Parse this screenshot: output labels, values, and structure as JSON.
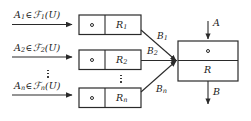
{
  "diagram": {
    "stroke_color": "#2a2a2a",
    "text_color": "#1a1a1a",
    "background": "#ffffff",
    "rows": [
      {
        "input_label_prefix": "A",
        "input_label_sub": "1",
        "membership_op": "∈",
        "family_symbol": "ℱ",
        "family_sub": "1",
        "family_arg": "(U)",
        "compose_symbol": "∘",
        "relation_label": "R",
        "relation_sub": "1",
        "output_label": "B",
        "output_sub": "1"
      },
      {
        "input_label_prefix": "A",
        "input_label_sub": "2",
        "membership_op": "∈",
        "family_symbol": "ℱ",
        "family_sub": "2",
        "family_arg": "(U)",
        "compose_symbol": "∘",
        "relation_label": "R",
        "relation_sub": "2",
        "output_label": "B",
        "output_sub": "2"
      },
      {
        "input_label_prefix": "A",
        "input_label_sub": "n",
        "membership_op": "∈",
        "family_symbol": "ℱ",
        "family_sub": "n",
        "family_arg": "(U)",
        "compose_symbol": "∘",
        "relation_label": "R",
        "relation_sub": "n",
        "output_label": "B",
        "output_sub": "n"
      }
    ],
    "ellipsis_left": "⋮",
    "ellipsis_mid": "⋮",
    "output_block": {
      "compose_symbol": "∘",
      "relation_label": "R",
      "input_arrow_label": "A",
      "output_arrow_label": "B"
    }
  }
}
